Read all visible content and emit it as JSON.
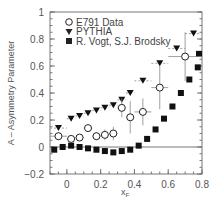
{
  "chart_data": {
    "type": "scatter",
    "title": "",
    "xlabel": "x_F",
    "ylabel": "A – Asymmetry Parameter",
    "xlim": [
      -0.1,
      0.8
    ],
    "ylim": [
      -0.2,
      1.0
    ],
    "xticks": [
      "0",
      "0.2",
      "0.4",
      "0.6",
      "0.8"
    ],
    "yticks": [
      "-0.2",
      "0",
      "0.2",
      "0.4",
      "0.6",
      "0.8",
      "1"
    ],
    "grid": false,
    "legend_position": "upper left",
    "reference_line_y": 0,
    "series": [
      {
        "name": "E791 Data",
        "marker": "open-circle",
        "points": [
          {
            "x": -0.05,
            "y": 0.08,
            "xerr": 0.05,
            "yerr": 0.03
          },
          {
            "x": 0.025,
            "y": 0.06,
            "xerr": 0.025,
            "yerr": 0.02
          },
          {
            "x": 0.075,
            "y": 0.07,
            "xerr": 0.025,
            "yerr": 0.02
          },
          {
            "x": 0.125,
            "y": 0.14,
            "xerr": 0.025,
            "yerr": 0.02
          },
          {
            "x": 0.175,
            "y": 0.08,
            "xerr": 0.025,
            "yerr": 0.03
          },
          {
            "x": 0.225,
            "y": 0.09,
            "xerr": 0.025,
            "yerr": 0.04
          },
          {
            "x": 0.275,
            "y": 0.1,
            "xerr": 0.025,
            "yerr": 0.05
          },
          {
            "x": 0.325,
            "y": 0.29,
            "xerr": 0.025,
            "yerr": 0.07
          },
          {
            "x": 0.375,
            "y": 0.22,
            "xerr": 0.025,
            "yerr": 0.12
          },
          {
            "x": 0.45,
            "y": 0.26,
            "xerr": 0.05,
            "yerr": 0.1
          },
          {
            "x": 0.55,
            "y": 0.44,
            "xerr": 0.05,
            "yerr": 0.16
          },
          {
            "x": 0.7,
            "y": 0.67,
            "xerr": 0.1,
            "yerr": 0.18
          }
        ]
      },
      {
        "name": "PYTHIA",
        "marker": "filled-down-triangle",
        "points": [
          {
            "x": -0.05,
            "y": 0.14,
            "xerr": 0.05
          },
          {
            "x": 0.025,
            "y": 0.21,
            "xerr": 0.025
          },
          {
            "x": 0.075,
            "y": 0.23,
            "xerr": 0.025
          },
          {
            "x": 0.125,
            "y": 0.25,
            "xerr": 0.025
          },
          {
            "x": 0.175,
            "y": 0.27,
            "xerr": 0.025
          },
          {
            "x": 0.225,
            "y": 0.29,
            "xerr": 0.025
          },
          {
            "x": 0.275,
            "y": 0.31,
            "xerr": 0.025
          },
          {
            "x": 0.325,
            "y": 0.35,
            "xerr": 0.025
          },
          {
            "x": 0.375,
            "y": 0.4,
            "xerr": 0.025
          },
          {
            "x": 0.45,
            "y": 0.49,
            "xerr": 0.05
          },
          {
            "x": 0.55,
            "y": 0.62,
            "xerr": 0.05
          },
          {
            "x": 0.65,
            "y": 0.73,
            "xerr": 0.05
          },
          {
            "x": 0.75,
            "y": 0.84,
            "xerr": 0.05
          }
        ]
      },
      {
        "name": "R. Vogt, S.J. Brodsky",
        "marker": "filled-square",
        "points": [
          {
            "x": -0.075,
            "y": -0.02
          },
          {
            "x": -0.025,
            "y": 0.0
          },
          {
            "x": 0.025,
            "y": 0.01
          },
          {
            "x": 0.075,
            "y": 0.0
          },
          {
            "x": 0.125,
            "y": -0.01
          },
          {
            "x": 0.175,
            "y": -0.02
          },
          {
            "x": 0.225,
            "y": -0.03
          },
          {
            "x": 0.275,
            "y": -0.04
          },
          {
            "x": 0.325,
            "y": -0.03
          },
          {
            "x": 0.375,
            "y": -0.02
          },
          {
            "x": 0.425,
            "y": 0.01
          },
          {
            "x": 0.475,
            "y": 0.06
          },
          {
            "x": 0.525,
            "y": 0.13
          },
          {
            "x": 0.575,
            "y": 0.21
          },
          {
            "x": 0.625,
            "y": 0.3
          },
          {
            "x": 0.675,
            "y": 0.4
          },
          {
            "x": 0.725,
            "y": 0.5
          },
          {
            "x": 0.775,
            "y": 0.59
          },
          {
            "x": 0.825,
            "y": 0.69
          }
        ]
      }
    ]
  },
  "legend": {
    "items": [
      {
        "label": "E791 Data",
        "icon": "open-circle-icon"
      },
      {
        "label": "PYTHIA",
        "icon": "down-triangle-icon"
      },
      {
        "label": "R. Vogt, S.J. Brodsky",
        "icon": "filled-square-icon"
      }
    ]
  },
  "axes": {
    "x_title_main": "x",
    "x_title_sub": "F",
    "y_title": "A – Asymmetry Parameter"
  },
  "colors": {
    "axis": "#777777",
    "marker": "#111111",
    "errorbar": "#888888",
    "text": "#555555"
  }
}
